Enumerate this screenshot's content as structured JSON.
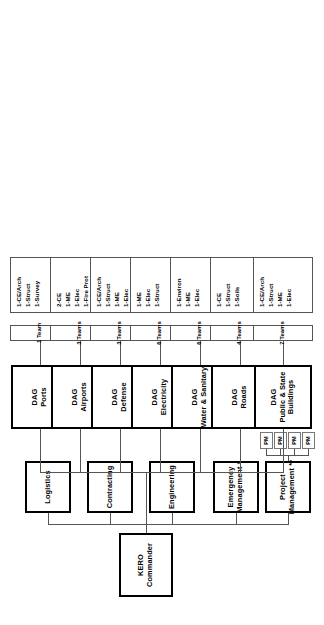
{
  "chart_data": {
    "type": "diagram",
    "orientation": "rotated-90",
    "root": "KERO Commander",
    "notes": [
      "*",
      "**"
    ]
  },
  "root": {
    "label_line1": "KERO",
    "label_line2": "Commander"
  },
  "staff": {
    "items": [
      {
        "label": "Logistics"
      },
      {
        "label": "Contracting"
      },
      {
        "label": "Engineering"
      },
      {
        "label_line1": "Emergency",
        "label_line2": "Management *"
      },
      {
        "label_line1": "Project",
        "label_line2": "Management **"
      }
    ]
  },
  "project_managers": {
    "items": [
      {
        "label": "PM"
      },
      {
        "label": "PM"
      },
      {
        "label": "PM"
      },
      {
        "label": "PM"
      }
    ]
  },
  "dags": [
    {
      "name_line1": "DAG",
      "name_line2": "Ports",
      "name_line3": "",
      "teams": "1 Team",
      "staff": [
        "1-CE/Arch",
        "1-Struct",
        "1-Survey"
      ]
    },
    {
      "name_line1": "DAG",
      "name_line2": "Airports",
      "name_line3": "",
      "teams": "3 Teams",
      "staff": [
        "2-CE",
        "1-ME",
        "1-Elec",
        "1-Fire Prot"
      ]
    },
    {
      "name_line1": "DAG",
      "name_line2": "Defense",
      "name_line3": "",
      "teams": "3 Teams",
      "staff": [
        "1-CE/Arch",
        "1-Struct",
        "1-ME",
        "1-Elec"
      ]
    },
    {
      "name_line1": "DAG",
      "name_line2": "Electricity",
      "name_line3": "",
      "teams": "6 Teams",
      "staff": [
        "1-ME",
        "1-Elec",
        "1-Struct"
      ]
    },
    {
      "name_line1": "DAG",
      "name_line2": "Water & Sanitary",
      "name_line3": "",
      "teams": "6 Teams",
      "staff": [
        "1-Environ",
        "1-ME",
        "1-Elec"
      ]
    },
    {
      "name_line1": "DAG",
      "name_line2": "Roads",
      "name_line3": "",
      "teams": "4 Teams",
      "staff": [
        "1-CE",
        "1-Struct",
        "1-Soils"
      ]
    },
    {
      "name_line1": "DAG",
      "name_line2": "Public & State",
      "name_line3": "Buildings",
      "teams": "7 Teams",
      "staff": [
        "1-CE/Arch",
        "1-Struct",
        "1-ME",
        "1-Elec"
      ]
    }
  ],
  "colors": {
    "ink": "#000000",
    "line": "#555555",
    "paper": "#ffffff"
  }
}
